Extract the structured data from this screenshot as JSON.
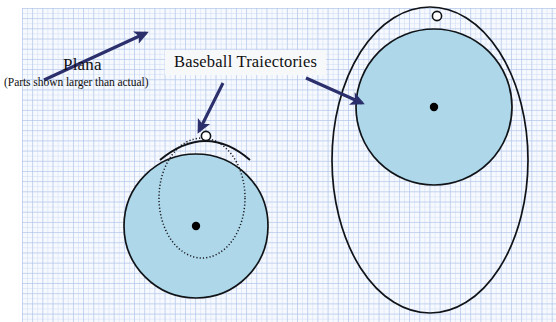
{
  "figure": {
    "title_label": "Plana",
    "subtitle_label": "(Parts shown larger than actual)",
    "trajectories_label": "Baseball Traiectories",
    "background": "blue graph paper",
    "colors": {
      "sphere_fill": "#aed8e9",
      "outline": "#101418",
      "arrow": "#2b2f6b",
      "grid_line": "#96afe1",
      "paper": "#fdfdff",
      "marker_ball": "#ffffff",
      "marker_center": "#000000"
    },
    "annotations": [
      {
        "name": "plana-arrow",
        "from": [
          44,
          80
        ],
        "to": [
          148,
          32
        ],
        "points_to": "graph paper plane"
      },
      {
        "name": "trajectory-arrow-left",
        "from": [
          222,
          83
        ],
        "to": [
          198,
          134
        ],
        "points_to": "small baseball trajectory"
      },
      {
        "name": "trajectory-arrow-right",
        "from": [
          306,
          78
        ],
        "to": [
          364,
          104
        ],
        "points_to": "large baseball trajectory"
      }
    ],
    "small_figure": {
      "name": "small-sphere-group",
      "sphere": {
        "cx": 196,
        "cy": 226,
        "r": 72
      },
      "trajectory_ellipse": {
        "cx": 202,
        "cy": 198,
        "rx": 43,
        "ry": 60,
        "style": "dotted"
      },
      "trajectory_arc": {
        "apex": [
          206,
          136
        ],
        "style": "solid"
      },
      "ball_marker": [
        206,
        136
      ],
      "center_marker": [
        196,
        226
      ]
    },
    "large_figure": {
      "name": "large-sphere-group",
      "sphere": {
        "cx": 434,
        "cy": 107,
        "r": 78
      },
      "trajectory_ellipse": {
        "cx": 430,
        "cy": 160,
        "rx": 98,
        "ry": 153,
        "style": "solid"
      },
      "ball_marker": [
        437,
        16
      ],
      "center_marker": [
        434,
        107
      ]
    }
  }
}
